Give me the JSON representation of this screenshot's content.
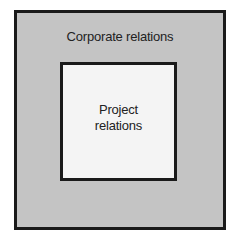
{
  "diagram": {
    "type": "nested-boxes",
    "outer": {
      "label": "Corporate relations",
      "fill": "#c4c4c4",
      "border": "#1a1a1a"
    },
    "inner": {
      "label_line1": "Project",
      "label_line2": "relations",
      "fill": "#f4f4f4",
      "border": "#1a1a1a"
    }
  }
}
